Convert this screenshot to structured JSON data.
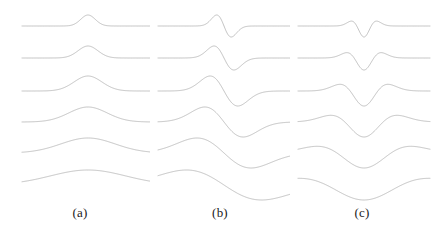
{
  "figure": {
    "background_color": "#ffffff",
    "trace_color": "#a8a8a8",
    "label_color": "#1a1a1a",
    "width": 434,
    "height": 231
  },
  "panels": [
    {
      "id": "panel-a",
      "label": "(a)",
      "label_y": 205,
      "x": 10,
      "width": 140,
      "plot_left": 12,
      "plot_width": 132,
      "wavelet": "gaussian",
      "derivative_order": 0
    },
    {
      "id": "panel-b",
      "label": "(b)",
      "label_y": 205,
      "x": 150,
      "width": 140,
      "plot_left": 8,
      "plot_width": 132,
      "wavelet": "gaussian-first-derivative",
      "derivative_order": 1
    },
    {
      "id": "panel-c",
      "label": "(c)",
      "label_y": 205,
      "x": 290,
      "width": 144,
      "plot_left": 8,
      "plot_width": 132,
      "wavelet": "gaussian-negative-second-derivative",
      "derivative_order": 2
    }
  ],
  "chart_data": {
    "type": "line",
    "title": "",
    "xlabel": "",
    "ylabel": "",
    "grid": false,
    "legend": "none",
    "panel_labels": [
      "(a)",
      "(b)",
      "(c)"
    ],
    "rows": 6,
    "row_baselines_y": [
      26,
      58,
      91,
      122,
      153,
      185
    ],
    "row_scales": [
      0.055,
      0.075,
      0.105,
      0.145,
      0.205,
      0.285
    ],
    "row_amplitudes": [
      11,
      12,
      15,
      15,
      15,
      15
    ],
    "x_range": [
      -1,
      1
    ],
    "x_samples": 301,
    "series": [
      {
        "name": "(a) Gaussian",
        "panel": "panel-a",
        "formula": "exp(-t^2/2)",
        "derivative_order": 0,
        "symmetry": "even",
        "lobes": 1,
        "peak_sign": "positive"
      },
      {
        "name": "(b) First derivative of Gaussian",
        "panel": "panel-b",
        "formula": "-t*exp(-t^2/2)",
        "derivative_order": 1,
        "symmetry": "odd",
        "lobes": 2,
        "peak_sign": "positive-then-negative"
      },
      {
        "name": "(c) Negative second derivative of Gaussian",
        "panel": "panel-c",
        "formula": "-(1 - t^2)*exp(-t^2/2)",
        "derivative_order": 2,
        "symmetry": "even",
        "lobes": 3,
        "peak_sign": "central-negative-with-positive-side-lobes"
      }
    ]
  }
}
